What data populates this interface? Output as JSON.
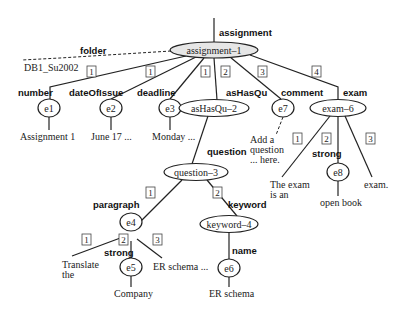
{
  "diagram": {
    "root_edge_label": "assignment",
    "root": {
      "id": "assignment-1",
      "label": "assignment–1"
    },
    "folder": {
      "edge_label": "folder",
      "value": "DB1_Su2002"
    },
    "children": [
      {
        "index": "1",
        "edge_label": "number",
        "node": "e1",
        "value": "Assignment 1"
      },
      {
        "index": "1",
        "edge_label": "dateOfIssue",
        "node": "e2",
        "value": "June 17 ..."
      },
      {
        "index": "1",
        "edge_label": "deadline",
        "node": "e3",
        "value": "Monday ..."
      },
      {
        "index": "2",
        "edge_label": "asHasQu",
        "node": "asHasQu–2"
      },
      {
        "index": "3",
        "edge_label": "comment",
        "node": "e7",
        "value_lines": [
          "Add a",
          "question",
          "... here."
        ]
      },
      {
        "index": "4",
        "edge_label": "exam",
        "node": "exam–6"
      }
    ],
    "question": {
      "edge_label": "question",
      "node": "question–3",
      "paragraph": {
        "index": "1",
        "edge_label": "paragraph",
        "node": "e4",
        "children": [
          {
            "index": "1",
            "value_lines": [
              "Translate",
              "the"
            ]
          },
          {
            "index": "2",
            "edge_label": "strong",
            "node": "e5",
            "value": "Company"
          },
          {
            "index": "3",
            "value": "ER schema ..."
          }
        ]
      },
      "keyword": {
        "index": "2",
        "edge_label": "keyword",
        "node": "keyword–4",
        "name": {
          "edge_label": "name",
          "node": "e6",
          "value": "ER schema"
        }
      }
    },
    "exam": {
      "children": [
        {
          "index": "1",
          "value_lines": [
            "The exam",
            "is an"
          ]
        },
        {
          "index": "2",
          "edge_label": "strong",
          "node": "e8",
          "value": "open book"
        },
        {
          "index": "3",
          "value": "exam."
        }
      ]
    }
  }
}
